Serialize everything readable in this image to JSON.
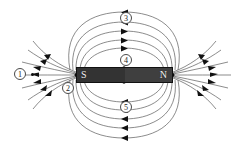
{
  "diagram": {
    "background_color": "#ffffff",
    "line_color": "#555555",
    "arrow_color": "#111111",
    "magnet": {
      "south_label": "S",
      "north_label": "N",
      "south_color": "#333333",
      "north_color": "#3f3f3f",
      "border_color": "#111111",
      "label_color": "#f2f2f2",
      "x": 76,
      "y": 67,
      "width": 97,
      "height": 16
    },
    "callouts": [
      {
        "id": "1",
        "label": "①",
        "text": "1",
        "x": 14,
        "y": 68,
        "region": "left-fan-field-lines"
      },
      {
        "id": "2",
        "label": "②",
        "text": "2",
        "x": 62,
        "y": 82,
        "region": "lower-left-loop"
      },
      {
        "id": "3",
        "label": "③",
        "text": "3",
        "x": 120,
        "y": 12,
        "region": "outer-upper-loop"
      },
      {
        "id": "4",
        "label": "④",
        "text": "4",
        "x": 120,
        "y": 54,
        "region": "inner-upper-loop"
      },
      {
        "id": "5",
        "label": "⑤",
        "text": "5",
        "x": 120,
        "y": 101,
        "region": "lower-loops"
      }
    ],
    "field": {
      "loop_count_upper": 5,
      "loop_count_lower": 5,
      "fan_lines_left": 7,
      "fan_lines_right": 7,
      "arrow_direction_top": "left",
      "arrow_direction_bottom": "left",
      "arrow_direction_left_fan": "outward-left",
      "arrow_direction_right_fan": "inward-left"
    }
  }
}
